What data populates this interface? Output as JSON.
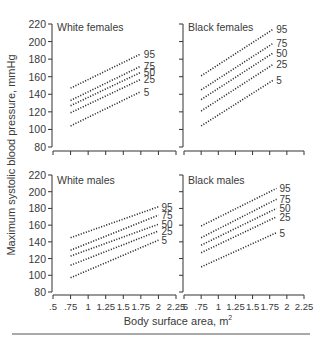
{
  "figure": {
    "ylabel": "Maximum systolic blood pressure, mmHg",
    "xlabel": "Body surface area, m",
    "xlabel_sup": "2"
  },
  "chart_data": [
    {
      "type": "line",
      "title": "White females",
      "xlabel": "Body surface area, m2",
      "ylabel": "Maximum systolic blood pressure, mmHg",
      "xlim": [
        0.5,
        2.25
      ],
      "ylim": [
        80,
        220
      ],
      "x_ticks": [
        ".5",
        ".75",
        "1",
        "1.25",
        "1.5",
        "1.75",
        "2",
        "2.25"
      ],
      "y_ticks": [
        "80",
        "100",
        "120",
        "140",
        "160",
        "180",
        "200",
        "220"
      ],
      "series": [
        {
          "name": "95",
          "x": [
            0.75,
            1.75
          ],
          "values": [
            147,
            186
          ]
        },
        {
          "name": "75",
          "x": [
            0.75,
            1.75
          ],
          "values": [
            133,
            172
          ]
        },
        {
          "name": "50",
          "x": [
            0.75,
            1.75
          ],
          "values": [
            127,
            165
          ]
        },
        {
          "name": "25",
          "x": [
            0.75,
            1.75
          ],
          "values": [
            119,
            157
          ]
        },
        {
          "name": "5",
          "x": [
            0.75,
            1.75
          ],
          "values": [
            104,
            143
          ]
        }
      ]
    },
    {
      "type": "line",
      "title": "Black females",
      "xlabel": "Body surface area, m2",
      "ylabel": "Maximum systolic blood pressure, mmHg",
      "xlim": [
        0.5,
        2.25
      ],
      "ylim": [
        80,
        220
      ],
      "x_ticks": [
        ".5",
        ".75",
        "1",
        "1.25",
        "1.5",
        "1.75",
        "2",
        "2.25"
      ],
      "y_ticks": [
        "80",
        "100",
        "120",
        "140",
        "160",
        "180",
        "200",
        "220"
      ],
      "series": [
        {
          "name": "95",
          "x": [
            0.75,
            1.8
          ],
          "values": [
            161,
            214
          ]
        },
        {
          "name": "75",
          "x": [
            0.75,
            1.8
          ],
          "values": [
            145,
            198
          ]
        },
        {
          "name": "50",
          "x": [
            0.75,
            1.8
          ],
          "values": [
            134,
            187
          ]
        },
        {
          "name": "25",
          "x": [
            0.75,
            1.8
          ],
          "values": [
            121,
            174
          ]
        },
        {
          "name": "5",
          "x": [
            0.75,
            1.8
          ],
          "values": [
            104,
            156
          ]
        }
      ]
    },
    {
      "type": "line",
      "title": "White males",
      "xlabel": "Body surface area, m2",
      "ylabel": "Maximum systolic blood pressure, mmHg",
      "xlim": [
        0.5,
        2.25
      ],
      "ylim": [
        80,
        220
      ],
      "x_ticks": [
        ".5",
        ".75",
        "1",
        "1.25",
        "1.5",
        "1.75",
        "2",
        "2.25"
      ],
      "y_ticks": [
        "80",
        "100",
        "120",
        "140",
        "160",
        "180",
        "200",
        "220"
      ],
      "series": [
        {
          "name": "95",
          "x": [
            0.75,
            2.0
          ],
          "values": [
            145,
            182
          ]
        },
        {
          "name": "75",
          "x": [
            0.75,
            2.0
          ],
          "values": [
            130,
            172
          ]
        },
        {
          "name": "50",
          "x": [
            0.75,
            2.0
          ],
          "values": [
            123,
            161
          ]
        },
        {
          "name": "25",
          "x": [
            0.75,
            2.0
          ],
          "values": [
            112,
            153
          ]
        },
        {
          "name": "5",
          "x": [
            0.75,
            2.0
          ],
          "values": [
            97,
            142
          ]
        }
      ]
    },
    {
      "type": "line",
      "title": "Black males",
      "xlabel": "Body surface area, m2",
      "ylabel": "Maximum systolic blood pressure, mmHg",
      "xlim": [
        0.5,
        2.25
      ],
      "ylim": [
        80,
        220
      ],
      "x_ticks": [
        ".5",
        ".75",
        "1",
        "1.25",
        "1.5",
        "1.75",
        "2",
        "2.25"
      ],
      "y_ticks": [
        "80",
        "100",
        "120",
        "140",
        "160",
        "180",
        "200",
        "220"
      ],
      "series": [
        {
          "name": "95",
          "x": [
            0.75,
            1.85
          ],
          "values": [
            159,
            204
          ]
        },
        {
          "name": "75",
          "x": [
            0.75,
            1.85
          ],
          "values": [
            145,
            191
          ]
        },
        {
          "name": "50",
          "x": [
            0.75,
            1.85
          ],
          "values": [
            136,
            180
          ]
        },
        {
          "name": "25",
          "x": [
            0.75,
            1.85
          ],
          "values": [
            127,
            170
          ]
        },
        {
          "name": "5",
          "x": [
            0.75,
            1.85
          ],
          "values": [
            110,
            151
          ]
        }
      ]
    }
  ]
}
